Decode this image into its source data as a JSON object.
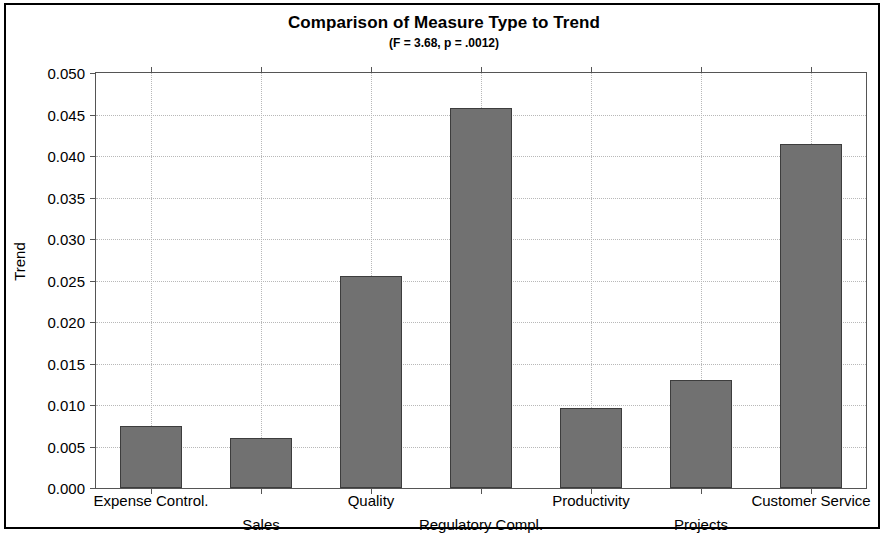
{
  "chart_data": {
    "type": "bar",
    "title": "Comparison of Measure Type to Trend",
    "subtitle": "(F = 3.68, p = .0012)",
    "xlabel": "",
    "ylabel": "Trend",
    "categories": [
      "Expense Control.",
      "Sales",
      "Quality",
      "Regulatory Compl.",
      "Productivity",
      "Projects",
      "Customer Service"
    ],
    "values": [
      0.0075,
      0.006,
      0.0256,
      0.0458,
      0.0096,
      0.013,
      0.0415
    ],
    "ylim": [
      0.0,
      0.05
    ],
    "ytick_values": [
      0.0,
      0.005,
      0.01,
      0.015,
      0.02,
      0.025,
      0.03,
      0.035,
      0.04,
      0.045,
      0.05
    ],
    "ytick_labels": [
      "0.000",
      "0.005",
      "0.010",
      "0.015",
      "0.020",
      "0.025",
      "0.030",
      "0.035",
      "0.040",
      "0.045",
      "0.050"
    ],
    "grid": true,
    "legend": null,
    "bar_color": "#717171",
    "bar_edge_color": "#3d3d3d",
    "grid_color": "#b8b8b8",
    "axis_color": "#555555",
    "frame_color": "#000000"
  }
}
